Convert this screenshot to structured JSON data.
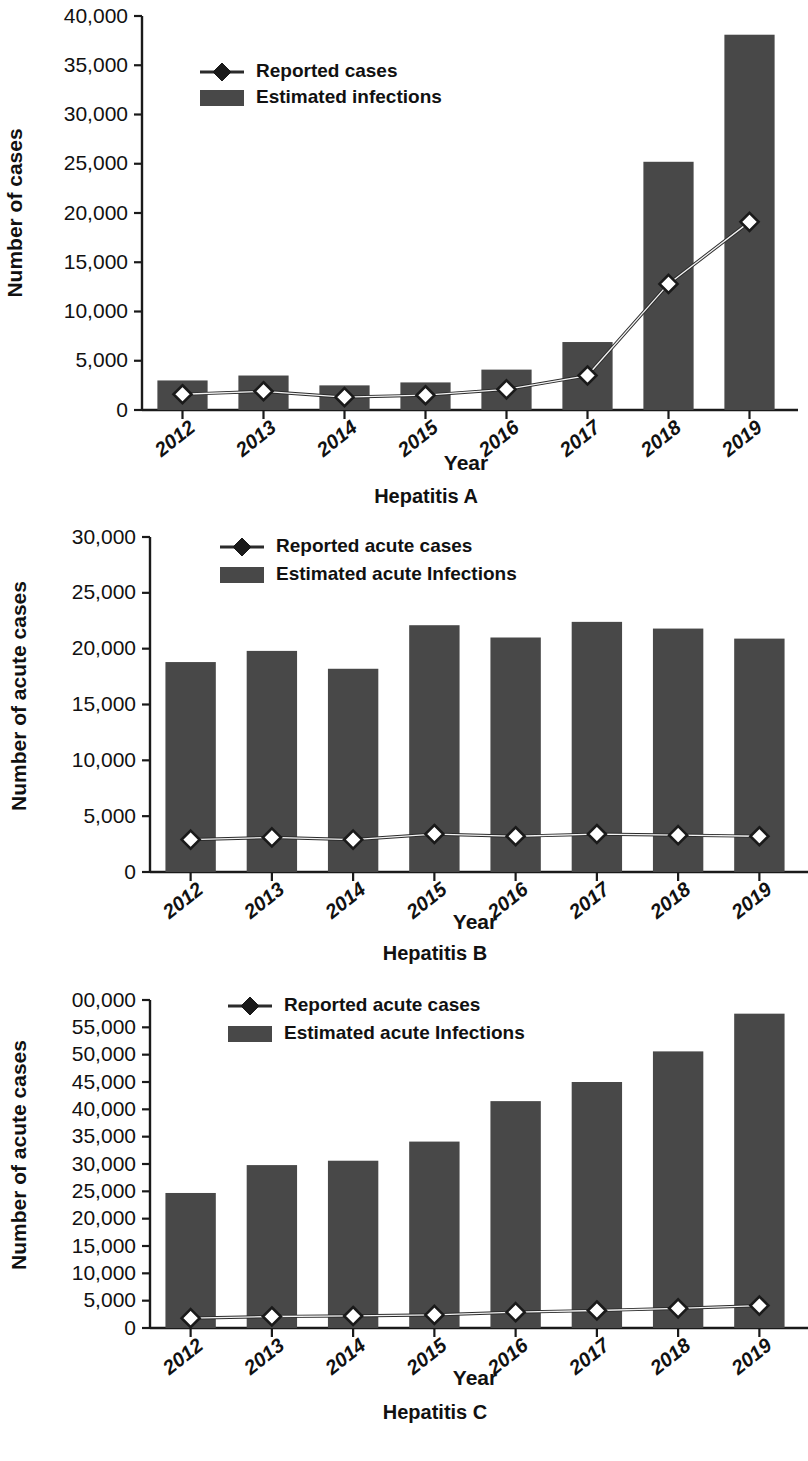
{
  "figure": {
    "colors": {
      "bar": "#484848",
      "line": "#2b2b2b",
      "marker_fill": "#ffffff",
      "marker_stroke": "#1a1a1a",
      "text": "#111111",
      "background": "#ffffff"
    }
  },
  "panels": [
    {
      "id": "a",
      "title": "Hepatitis A",
      "xlabel": "Year",
      "ylabel": "Number of cases",
      "legend": {
        "line_label": "Reported cases",
        "bar_label": "Estimated infections"
      },
      "yticks": [
        "0",
        "5,000",
        "10,000",
        "15,000",
        "20,000",
        "25,000",
        "30,000",
        "35,000",
        "40,000"
      ],
      "xticks": [
        "2012",
        "2013",
        "2014",
        "2015",
        "2016",
        "2017",
        "2018",
        "2019"
      ]
    },
    {
      "id": "b",
      "title": "Hepatitis B",
      "xlabel": "Year",
      "ylabel": "Number of acute cases",
      "legend": {
        "line_label": "Reported acute cases",
        "bar_label": "Estimated acute Infections"
      },
      "yticks": [
        "0",
        "5,000",
        "10,000",
        "15,000",
        "20,000",
        "25,000",
        "30,000"
      ],
      "xticks": [
        "2012",
        "2013",
        "2014",
        "2015",
        "2016",
        "2017",
        "2018",
        "2019"
      ]
    },
    {
      "id": "c",
      "title": "Hepatitis C",
      "xlabel": "Year",
      "ylabel": "Number of acute cases",
      "legend": {
        "line_label": "Reported acute cases",
        "bar_label": "Estimated acute Infections"
      },
      "yticks": [
        "0",
        "5,000",
        "10,000",
        "15,000",
        "20,000",
        "25,000",
        "30,000",
        "35,000",
        "40,000",
        "45,000",
        "50,000",
        "55,000",
        "00,000"
      ],
      "xticks": [
        "2012",
        "2013",
        "2014",
        "2015",
        "2016",
        "2017",
        "2018",
        "2019"
      ]
    }
  ],
  "chart_data": [
    {
      "type": "bar",
      "title": "Hepatitis A",
      "xlabel": "Year",
      "ylabel": "Number of cases",
      "categories": [
        "2012",
        "2013",
        "2014",
        "2015",
        "2016",
        "2017",
        "2018",
        "2019"
      ],
      "ylim": [
        0,
        40000
      ],
      "ytick_values": [
        0,
        5000,
        10000,
        15000,
        20000,
        25000,
        30000,
        35000,
        40000
      ],
      "grid": false,
      "legend_position": "top-left-inside",
      "series": [
        {
          "name": "Estimated infections",
          "type": "bar",
          "values": [
            3000,
            3500,
            2500,
            2800,
            4100,
            6900,
            25200,
            38100
          ]
        },
        {
          "name": "Reported cases",
          "type": "line",
          "values": [
            1600,
            1900,
            1300,
            1500,
            2100,
            3500,
            12800,
            19100
          ]
        }
      ]
    },
    {
      "type": "bar",
      "title": "Hepatitis B",
      "xlabel": "Year",
      "ylabel": "Number of acute cases",
      "categories": [
        "2012",
        "2013",
        "2014",
        "2015",
        "2016",
        "2017",
        "2018",
        "2019"
      ],
      "ylim": [
        0,
        30000
      ],
      "ytick_values": [
        0,
        5000,
        10000,
        15000,
        20000,
        25000,
        30000
      ],
      "grid": false,
      "legend_position": "top-left-inside",
      "series": [
        {
          "name": "Estimated acute Infections",
          "type": "bar",
          "values": [
            18800,
            19800,
            18200,
            22100,
            21000,
            22400,
            21800,
            20900
          ]
        },
        {
          "name": "Reported acute cases",
          "type": "line",
          "values": [
            2900,
            3100,
            2900,
            3400,
            3200,
            3400,
            3300,
            3200
          ]
        }
      ]
    },
    {
      "type": "bar",
      "title": "Hepatitis C",
      "xlabel": "Year",
      "ylabel": "Number of acute cases",
      "categories": [
        "2012",
        "2013",
        "2014",
        "2015",
        "2016",
        "2017",
        "2018",
        "2019"
      ],
      "ylim": [
        0,
        60000
      ],
      "ytick_values": [
        0,
        5000,
        10000,
        15000,
        20000,
        25000,
        30000,
        35000,
        40000,
        45000,
        50000,
        55000,
        60000
      ],
      "grid": false,
      "legend_position": "top-left-inside",
      "series": [
        {
          "name": "Estimated acute Infections",
          "type": "bar",
          "values": [
            24700,
            29800,
            30600,
            34100,
            41500,
            45000,
            50600,
            57500
          ]
        },
        {
          "name": "Reported acute cases",
          "type": "line",
          "values": [
            1800,
            2100,
            2200,
            2400,
            2900,
            3200,
            3600,
            4100
          ]
        }
      ]
    }
  ]
}
